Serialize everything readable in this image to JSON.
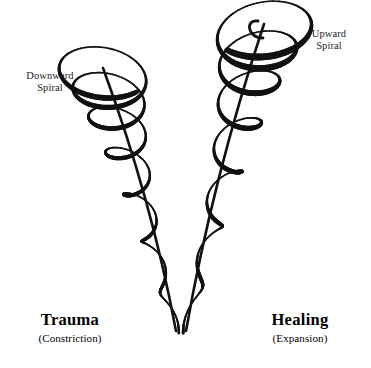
{
  "canvas": {
    "width": 371,
    "height": 368,
    "background_color": "#ffffff",
    "ink_color": "#111111"
  },
  "annotations": {
    "downward_spiral": "Downward\nSpiral",
    "upward_spiral": "Upward\nSpiral"
  },
  "axis_labels": {
    "left": {
      "title": "Trauma",
      "subtitle": "(Constriction)"
    },
    "right": {
      "title": "Healing",
      "subtitle": "(Expansion)"
    }
  },
  "chart_data": {
    "type": "diagram",
    "vertex": {
      "x": 180,
      "y": 331
    },
    "spirals": [
      {
        "name": "downward-spiral",
        "side": "left",
        "direction": "downward",
        "turns": 7,
        "top_point": {
          "x": 103,
          "y": 68
        },
        "bottom_point": {
          "x": 176,
          "y": 331
        },
        "max_radius_x": 48,
        "min_radius_x": 4,
        "max_radius_y": 30,
        "min_radius_y": 3,
        "stroke_min": 1.6,
        "stroke_max": 5.6,
        "has_top_hook": false
      },
      {
        "name": "upward-spiral",
        "side": "right",
        "direction": "upward",
        "turns": 7,
        "top_point": {
          "x": 264,
          "y": 24
        },
        "bottom_point": {
          "x": 186,
          "y": 331
        },
        "max_radius_x": 52,
        "min_radius_x": 4,
        "max_radius_y": 33,
        "min_radius_y": 3,
        "stroke_min": 1.6,
        "stroke_max": 7.0,
        "has_top_hook": true
      }
    ]
  }
}
